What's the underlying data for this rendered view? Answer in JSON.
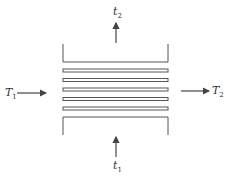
{
  "diagram": {
    "type": "heat-exchanger-schematic",
    "line_color": "#555555",
    "tube_count": 5,
    "labels": {
      "hot_inlet": {
        "symbol": "T",
        "sub": "1"
      },
      "hot_outlet": {
        "symbol": "T",
        "sub": "2"
      },
      "cold_inlet": {
        "symbol": "t",
        "sub": "1"
      },
      "cold_outlet": {
        "symbol": "t",
        "sub": "2"
      }
    }
  }
}
